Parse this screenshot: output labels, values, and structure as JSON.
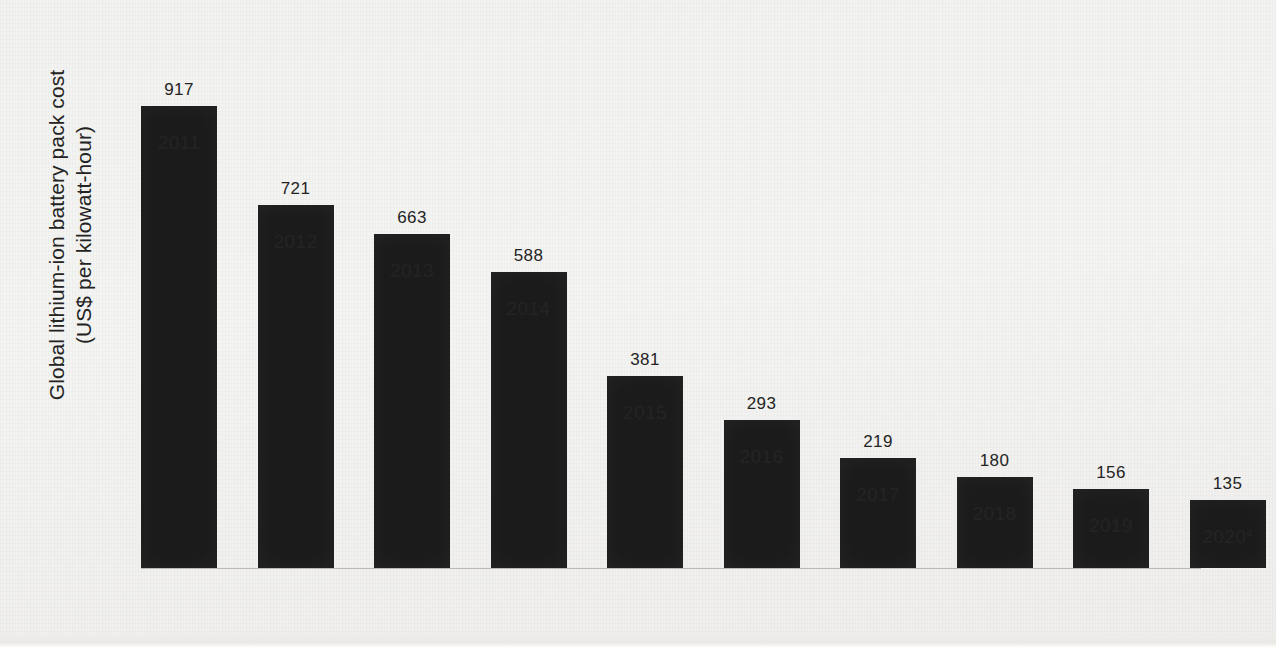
{
  "chart_data": {
    "type": "bar",
    "title": "",
    "subtitle": "",
    "xlabel": "",
    "ylabel_line1": "Global lithium-ion battery pack cost",
    "ylabel_line2": "(US$ per kilowatt-hour)",
    "categories": [
      "2011",
      "2012",
      "2013",
      "2014",
      "2015",
      "2016",
      "2017",
      "2018",
      "2019",
      "2020"
    ],
    "category_labels": [
      "2011",
      "2012",
      "2013",
      "2014",
      "2015",
      "2016",
      "2017",
      "2018",
      "2019",
      "2020"
    ],
    "category_superscripts": [
      "",
      "",
      "",
      "",
      "",
      "",
      "",
      "",
      "",
      "a"
    ],
    "values": [
      917,
      721,
      663,
      588,
      381,
      293,
      219,
      180,
      156,
      135
    ],
    "value_labels": [
      "917",
      "721",
      "663",
      "588",
      "381",
      "293",
      "219",
      "180",
      "156",
      "135"
    ],
    "ylim": [
      0,
      1000
    ],
    "grid": false,
    "legend": false,
    "legend_position": "none",
    "bar_color": "#1c1b1b",
    "background_color": "#f2f2f0",
    "axis_color": "#b9b8b5",
    "text_color": "#242424"
  },
  "footnote_marker": "a"
}
